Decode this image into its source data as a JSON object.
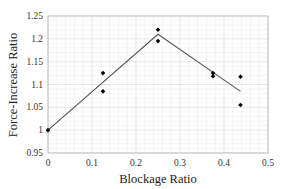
{
  "chart_data": {
    "type": "scatter",
    "title": "",
    "xlabel": "Blockage Ratio",
    "ylabel": "Force-Increase Ratio",
    "xlim": [
      0,
      0.5
    ],
    "ylim": [
      0.95,
      1.25
    ],
    "x_ticks": [
      "0",
      "0.1",
      "0.2",
      "0.3",
      "0.4",
      "0.5"
    ],
    "y_ticks": [
      "0.95",
      "1",
      "1.05",
      "1.1",
      "1.15",
      "1.2",
      "1.25"
    ],
    "grid": true,
    "legend": null,
    "series": [
      {
        "name": "measured",
        "kind": "scatter",
        "marker": "diamond",
        "color": "#000000",
        "points": [
          {
            "x": 0.0,
            "y": 1.0
          },
          {
            "x": 0.125,
            "y": 1.125
          },
          {
            "x": 0.125,
            "y": 1.085
          },
          {
            "x": 0.25,
            "y": 1.22
          },
          {
            "x": 0.25,
            "y": 1.195
          },
          {
            "x": 0.375,
            "y": 1.125
          },
          {
            "x": 0.375,
            "y": 1.118
          },
          {
            "x": 0.4375,
            "y": 1.117
          },
          {
            "x": 0.4375,
            "y": 1.055
          }
        ]
      },
      {
        "name": "fit",
        "kind": "line",
        "color": "#555555",
        "points": [
          {
            "x": 0.0,
            "y": 1.0
          },
          {
            "x": 0.25,
            "y": 1.21
          },
          {
            "x": 0.4375,
            "y": 1.085
          }
        ]
      }
    ]
  }
}
